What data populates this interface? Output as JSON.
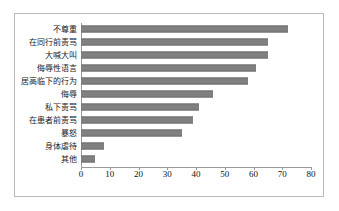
{
  "chart_data": {
    "type": "bar",
    "orientation": "horizontal",
    "title": "",
    "subtitle": "",
    "xlabel": "",
    "ylabel": "",
    "xlim": [
      0,
      80
    ],
    "xticks": [
      0,
      10,
      20,
      30,
      40,
      50,
      60,
      70,
      80
    ],
    "grid": false,
    "legend": false,
    "bar_color": "#808080",
    "bar_edge_color": "#6e6e6e",
    "frame_color": "#b9b9b9",
    "axis_color": "#9a9a9a",
    "categories": [
      "其他",
      "身体虐待",
      "暴怒",
      "在患者前责骂",
      "私下责骂",
      "侮辱",
      "居高临下的行为",
      "侮辱性语言",
      "大喊大叫",
      "在同行前责骂",
      "不尊重"
    ],
    "values": [
      5,
      8,
      35,
      39,
      41,
      46,
      58,
      61,
      65,
      65,
      72
    ]
  }
}
